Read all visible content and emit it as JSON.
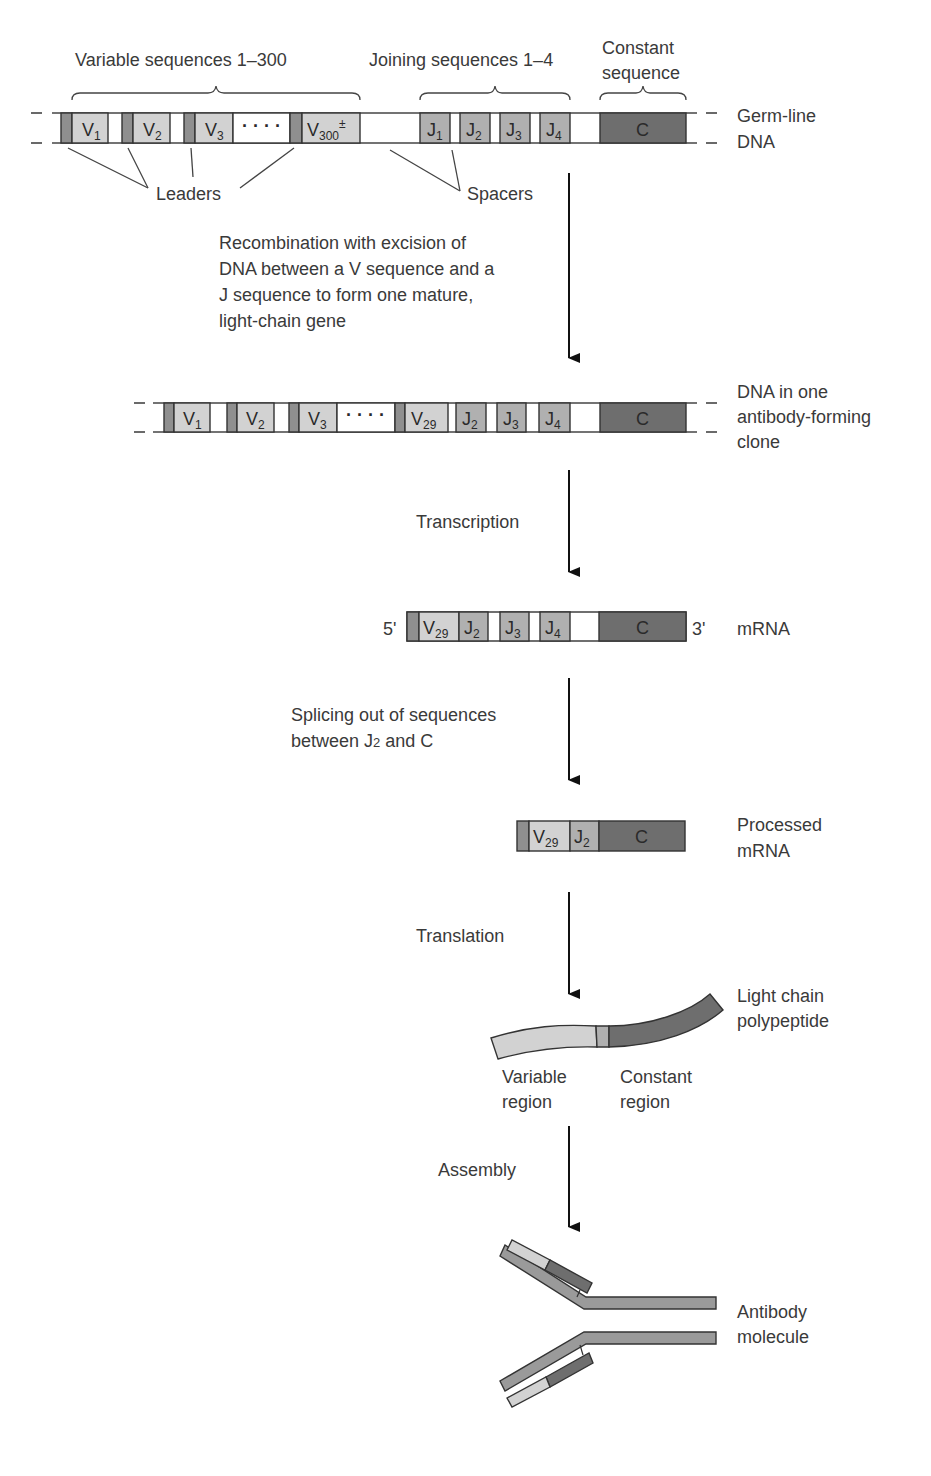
{
  "colors": {
    "leader": "#8f8f8f",
    "variable": "#d2d2d2",
    "joining": "#b0b0b0",
    "constant": "#6e6e6e",
    "outline": "#333333",
    "text": "#3a3a3a"
  },
  "germline": {
    "header_variable": "Variable sequences 1–300",
    "header_joining": "Joining sequences 1–4",
    "header_constant_line1": "Constant",
    "header_constant_line2": "sequence",
    "segments_v": [
      "V",
      "V",
      "V",
      "V"
    ],
    "subs_v": [
      "1",
      "2",
      "3",
      "300"
    ],
    "v300_sup": "±",
    "ellipsis": "· · · ·",
    "segments_j": [
      "J",
      "J",
      "J",
      "J"
    ],
    "subs_j": [
      "1",
      "2",
      "3",
      "4"
    ],
    "constant": "C",
    "label_line1": "Germ-line",
    "label_line2": "DNA",
    "leaders_label": "Leaders",
    "spacers_label": "Spacers"
  },
  "steps": {
    "recombination": [
      "Recombination with excision of",
      "DNA between a V sequence and a",
      "J sequence to form one mature,",
      "light-chain gene"
    ],
    "transcription": "Transcription",
    "splicing_line1": "Splicing out of sequences",
    "splicing_line2_a": "between J",
    "splicing_line2_sub": "2",
    "splicing_line2_b": " and C",
    "translation": "Translation",
    "assembly": "Assembly"
  },
  "clone_dna": {
    "segments": [
      "V",
      "V",
      "V",
      "V",
      "J",
      "J",
      "J"
    ],
    "subs": [
      "1",
      "2",
      "3",
      "29",
      "2",
      "3",
      "4"
    ],
    "ellipsis": "· · · ·",
    "constant": "C",
    "label_line1": "DNA in one",
    "label_line2": "antibody-forming",
    "label_line3": "clone"
  },
  "mrna": {
    "five_prime": "5'",
    "three_prime": "3'",
    "segments": [
      "V",
      "J",
      "J",
      "J"
    ],
    "subs": [
      "29",
      "2",
      "3",
      "4"
    ],
    "constant": "C",
    "label": "mRNA"
  },
  "processed_mrna": {
    "segments": [
      "V",
      "J"
    ],
    "subs": [
      "29",
      "2"
    ],
    "constant": "C",
    "label_line1": "Processed",
    "label_line2": "mRNA"
  },
  "polypeptide": {
    "label_line1": "Light chain",
    "label_line2": "polypeptide",
    "variable_line1": "Variable",
    "variable_line2": "region",
    "constant_line1": "Constant",
    "constant_line2": "region"
  },
  "antibody": {
    "label_line1": "Antibody",
    "label_line2": "molecule"
  }
}
